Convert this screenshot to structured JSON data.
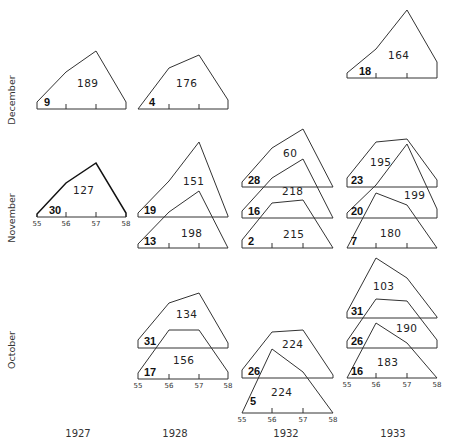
{
  "chart_data": {
    "type": "area",
    "title": "",
    "row_labels": [
      "December",
      "November",
      "October"
    ],
    "column_labels": [
      "1927",
      "1928",
      "1932",
      "1933"
    ],
    "x_ticks": [
      "55",
      "56",
      "57",
      "58"
    ],
    "xlim": [
      55,
      58
    ],
    "panels": [
      {
        "year": "1927",
        "month": "December",
        "count": "9",
        "total": "189",
        "bold": false
      },
      {
        "year": "1928",
        "month": "December",
        "count": "4",
        "total": "176",
        "bold": false
      },
      {
        "year": "1933",
        "month": "December",
        "count": "18",
        "total": "164",
        "bold": false
      },
      {
        "year": "1927",
        "month": "November",
        "count": "30",
        "total": "127",
        "bold": true
      },
      {
        "year": "1928",
        "month": "November",
        "count": "19",
        "total": "151",
        "bold": false
      },
      {
        "year": "1928",
        "month": "November",
        "count": "13",
        "total": "198",
        "bold": false
      },
      {
        "year": "1932",
        "month": "November",
        "count": "28",
        "total": "60",
        "bold": false
      },
      {
        "year": "1932",
        "month": "November",
        "count": "16",
        "total": "218",
        "bold": false
      },
      {
        "year": "1932",
        "month": "November",
        "count": "2",
        "total": "215",
        "bold": false
      },
      {
        "year": "1933",
        "month": "November",
        "count": "23",
        "total": "195",
        "bold": false
      },
      {
        "year": "1933",
        "month": "November",
        "count": "20",
        "total": "199",
        "bold": false
      },
      {
        "year": "1933",
        "month": "November",
        "count": "7",
        "total": "180",
        "bold": false
      },
      {
        "year": "1928",
        "month": "October",
        "count": "31",
        "total": "134",
        "bold": false
      },
      {
        "year": "1928",
        "month": "October",
        "count": "17",
        "total": "156",
        "bold": false
      },
      {
        "year": "1932",
        "month": "October",
        "count": "26",
        "total": "224",
        "bold": false
      },
      {
        "year": "1932",
        "month": "October",
        "count": "5",
        "total": "224",
        "bold": false
      },
      {
        "year": "1933",
        "month": "October",
        "count": "31",
        "total": "103",
        "bold": false
      },
      {
        "year": "1933",
        "month": "October",
        "count": "26",
        "total": "190",
        "bold": false
      },
      {
        "year": "1933",
        "month": "October",
        "count": "16",
        "total": "183",
        "bold": false
      }
    ]
  },
  "layout": {
    "columns": {
      "1927": {
        "x": [
          37,
          66,
          96,
          126
        ]
      },
      "1928": {
        "x": [
          138,
          169,
          199,
          228
        ]
      },
      "1932": {
        "x": [
          242,
          272,
          303,
          333
        ]
      },
      "1933": {
        "x": [
          347,
          376,
          407,
          437
        ]
      }
    },
    "polygons": [
      {
        "col": "1927",
        "base": 109,
        "tops": [
          102,
          72,
          51,
          102
        ],
        "ticks": true,
        "tick_labels": false,
        "count_xy": [
          44,
          106
        ],
        "total_xy": [
          77,
          87
        ]
      },
      {
        "col": "1928",
        "base": 109,
        "tops": [
          109,
          68,
          55,
          100
        ],
        "ticks": true,
        "tick_labels": false,
        "count_xy": [
          149,
          106
        ],
        "total_xy": [
          176,
          87
        ]
      },
      {
        "col": "1933",
        "base": 78,
        "tops": [
          73,
          49,
          10,
          62
        ],
        "ticks": true,
        "tick_labels": false,
        "count_xy": [
          359,
          75
        ],
        "total_xy": [
          388,
          59
        ]
      },
      {
        "col": "1927",
        "base": 217,
        "tops": [
          214,
          183,
          163,
          213
        ],
        "ticks": true,
        "tick_labels": true,
        "count_xy": [
          49,
          214
        ],
        "total_xy": [
          73,
          194
        ]
      },
      {
        "col": "1928",
        "base": 217,
        "tops": [
          213,
          181,
          142,
          216
        ],
        "ticks": false,
        "tick_labels": false,
        "count_xy": [
          144,
          214
        ],
        "total_xy": [
          183,
          185
        ]
      },
      {
        "col": "1928",
        "base": 248,
        "tops": [
          244,
          212,
          191,
          248
        ],
        "ticks": true,
        "tick_labels": false,
        "count_xy": [
          144,
          245
        ],
        "total_xy": [
          181,
          237
        ]
      },
      {
        "col": "1932",
        "base": 187,
        "tops": [
          182,
          148,
          129,
          187
        ],
        "ticks": false,
        "tick_labels": false,
        "count_xy": [
          248,
          184
        ],
        "total_xy": [
          283,
          157
        ]
      },
      {
        "col": "1932",
        "base": 218,
        "tops": [
          211,
          178,
          159,
          218
        ],
        "ticks": false,
        "tick_labels": false,
        "count_xy": [
          248,
          215
        ],
        "total_xy": [
          282,
          195
        ]
      },
      {
        "col": "1932",
        "base": 248,
        "tops": [
          240,
          203,
          200,
          248
        ],
        "ticks": true,
        "tick_labels": false,
        "count_xy": [
          248,
          245
        ],
        "total_xy": [
          283,
          238
        ]
      },
      {
        "col": "1933",
        "base": 187,
        "tops": [
          178,
          142,
          139,
          180
        ],
        "ticks": false,
        "tick_labels": false,
        "count_xy": [
          351,
          184
        ],
        "total_xy": [
          370,
          166
        ]
      },
      {
        "col": "1933",
        "base": 218,
        "tops": [
          213,
          185,
          144,
          209
        ],
        "ticks": false,
        "tick_labels": false,
        "count_xy": [
          351,
          215
        ],
        "total_xy": [
          404,
          199
        ]
      },
      {
        "col": "1933",
        "base": 248,
        "tops": [
          248,
          193,
          205,
          248
        ],
        "ticks": true,
        "tick_labels": false,
        "count_xy": [
          351,
          245
        ],
        "total_xy": [
          380,
          237
        ]
      },
      {
        "col": "1928",
        "base": 348,
        "tops": [
          340,
          303,
          293,
          343
        ],
        "ticks": false,
        "tick_labels": false,
        "count_xy": [
          144,
          345
        ],
        "total_xy": [
          176,
          318
        ]
      },
      {
        "col": "1928",
        "base": 379,
        "tops": [
          373,
          330,
          330,
          372
        ],
        "ticks": true,
        "tick_labels": true,
        "count_xy": [
          144,
          376
        ],
        "total_xy": [
          173,
          364
        ]
      },
      {
        "col": "1932",
        "base": 378,
        "tops": [
          370,
          332,
          330,
          375
        ],
        "ticks": false,
        "tick_labels": false,
        "count_xy": [
          248,
          375
        ],
        "total_xy": [
          282,
          348
        ]
      },
      {
        "col": "1932",
        "base": 413,
        "tops": [
          413,
          349,
          372,
          413
        ],
        "ticks": true,
        "tick_labels": true,
        "count_xy": [
          250,
          405
        ],
        "total_xy": [
          271,
          396
        ]
      },
      {
        "col": "1933",
        "base": 318,
        "tops": [
          312,
          258,
          278,
          317
        ],
        "ticks": false,
        "tick_labels": false,
        "count_xy": [
          351,
          315
        ],
        "total_xy": [
          373,
          290
        ]
      },
      {
        "col": "1933",
        "base": 348,
        "tops": [
          341,
          299,
          301,
          340
        ],
        "ticks": false,
        "tick_labels": false,
        "count_xy": [
          351,
          345
        ],
        "total_xy": [
          396,
          332
        ]
      },
      {
        "col": "1933",
        "base": 378,
        "tops": [
          378,
          323,
          343,
          378
        ],
        "ticks": true,
        "tick_labels": true,
        "count_xy": [
          351,
          375
        ],
        "total_xy": [
          377,
          366
        ]
      }
    ],
    "row_label_positions": [
      {
        "label_index": 0,
        "x": 12,
        "y": 100
      },
      {
        "label_index": 1,
        "x": 12,
        "y": 218
      },
      {
        "label_index": 2,
        "x": 12,
        "y": 350
      }
    ],
    "col_label_positions": [
      {
        "label_index": 0,
        "x": 78,
        "y": 437
      },
      {
        "label_index": 1,
        "x": 175,
        "y": 437
      },
      {
        "label_index": 2,
        "x": 286,
        "y": 437
      },
      {
        "label_index": 3,
        "x": 393,
        "y": 437
      }
    ]
  }
}
